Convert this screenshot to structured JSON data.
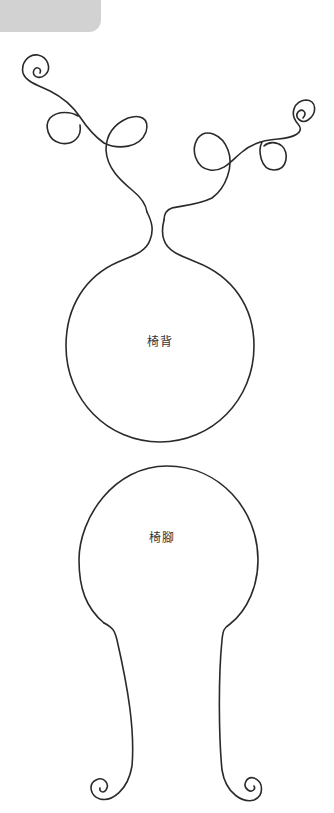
{
  "pattern": {
    "pieces": [
      {
        "label": "椅背",
        "name": "chair-back"
      },
      {
        "label": "椅腳",
        "name": "chair-leg"
      }
    ]
  },
  "colors": {
    "outline": "#2a2a2a",
    "tab": "#d2d2d2",
    "background": "#ffffff"
  }
}
